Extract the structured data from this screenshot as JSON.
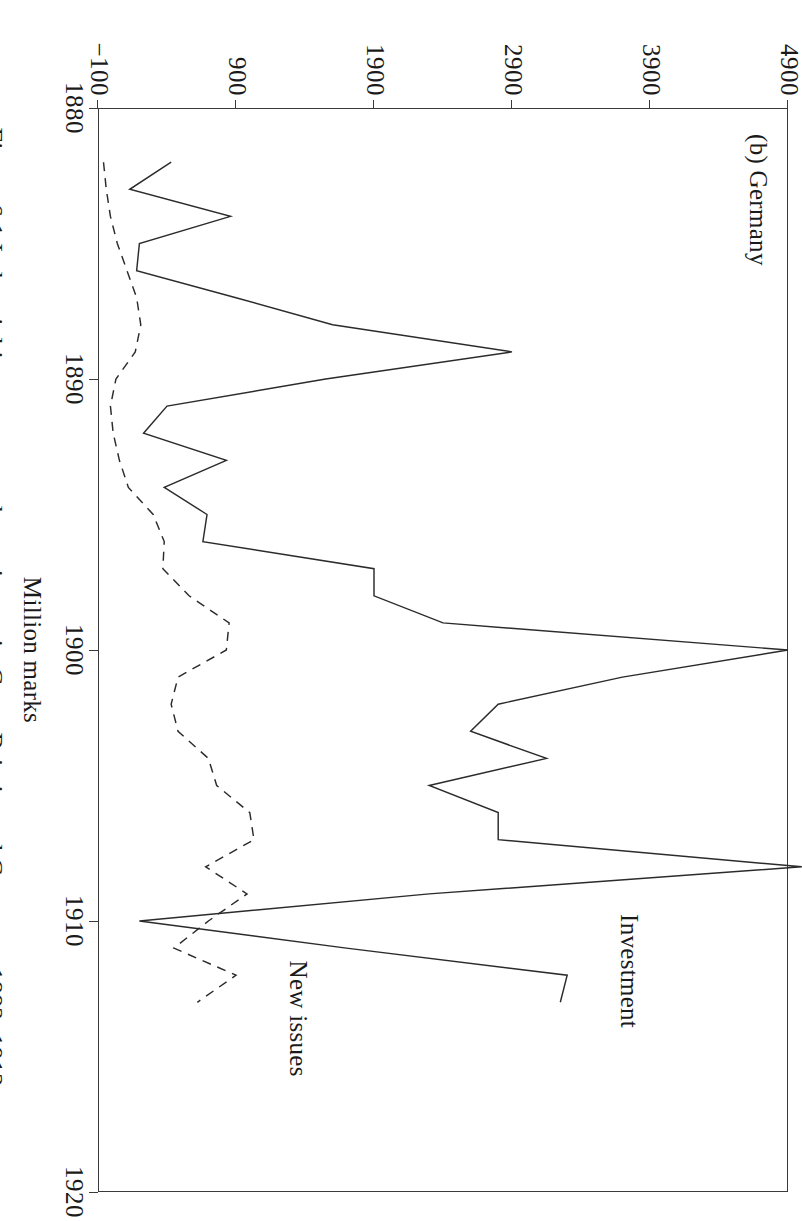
{
  "figure": {
    "caption": "Figure 6.1 Industrial investment and new issues in Great Britain and Germany, 1882–1913",
    "panel_label": "(b) Germany"
  },
  "chart_data": {
    "type": "line",
    "title": "(b) Germany",
    "xlabel": "",
    "ylabel": "Million marks",
    "xlim": [
      1880,
      1920
    ],
    "ylim": [
      -100,
      4900
    ],
    "xticks": [
      "1880",
      "1890",
      "1900",
      "1910",
      "1920"
    ],
    "yticks": [
      "-100",
      "900",
      "1900",
      "2900",
      "3900",
      "4900"
    ],
    "grid": false,
    "legend": "inline-labels",
    "annotations": [
      {
        "text": "Investment",
        "x": 1912.4,
        "y": 3560
      },
      {
        "text": "New issues",
        "x": 1913.6,
        "y": 1150
      }
    ],
    "series": [
      {
        "name": "Investment",
        "style": "solid",
        "color": "#2b2b2b",
        "x": [
          1882,
          1883,
          1884,
          1885,
          1886,
          1887,
          1888,
          1889,
          1890,
          1891,
          1892,
          1893,
          1894,
          1895,
          1896,
          1897,
          1898,
          1899,
          1900,
          1901,
          1902,
          1903,
          1904,
          1905,
          1906,
          1907,
          1908,
          1909,
          1910,
          1911,
          1912,
          1913
        ],
        "y": [
          430,
          130,
          860,
          200,
          180,
          900,
          1600,
          2900,
          1550,
          400,
          230,
          830,
          380,
          690,
          660,
          1900,
          1900,
          2400,
          4900,
          3700,
          2800,
          2600,
          3150,
          2300,
          2800,
          2800,
          5000,
          2300,
          200,
          1700,
          3300,
          3250
        ]
      },
      {
        "name": "New issues",
        "style": "dashed",
        "color": "#2b2b2b",
        "x": [
          1882,
          1883,
          1884,
          1885,
          1886,
          1887,
          1888,
          1889,
          1890,
          1891,
          1892,
          1893,
          1894,
          1895,
          1896,
          1897,
          1898,
          1899,
          1900,
          1901,
          1902,
          1903,
          1904,
          1905,
          1906,
          1907,
          1908,
          1909,
          1910,
          1911,
          1912,
          1913
        ],
        "y": [
          -60,
          -40,
          -10,
          40,
          110,
          180,
          210,
          170,
          30,
          -10,
          10,
          55,
          120,
          300,
          380,
          370,
          560,
          850,
          830,
          480,
          430,
          480,
          700,
          760,
          1000,
          1030,
          680,
          980,
          700,
          450,
          900,
          620
        ]
      }
    ]
  }
}
